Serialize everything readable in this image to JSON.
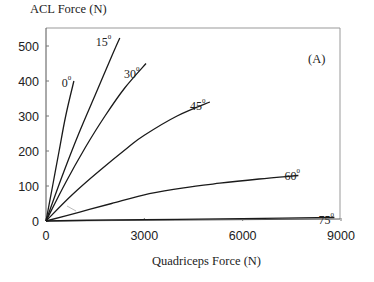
{
  "chart_data": {
    "type": "line",
    "title": "",
    "panel_label": "(A)",
    "xlabel": "Quadriceps Force (N)",
    "ylabel": "ACL Force (N)",
    "xlim": [
      0,
      9000
    ],
    "ylim": [
      0,
      550
    ],
    "xticks": [
      0,
      3000,
      6000,
      9000
    ],
    "yticks": [
      0,
      100,
      200,
      300,
      400,
      500
    ],
    "grid": false,
    "legend": "inline curve labels",
    "series": [
      {
        "name": "0°",
        "label": "0",
        "x": [
          0,
          200,
          400,
          600,
          850
        ],
        "y": [
          0,
          100,
          200,
          300,
          400
        ]
      },
      {
        "name": "15°",
        "label": "15",
        "x": [
          0,
          500,
          1000,
          1500,
          2000,
          2250
        ],
        "y": [
          0,
          130,
          250,
          360,
          470,
          523
        ]
      },
      {
        "name": "30°",
        "label": "30",
        "x": [
          0,
          600,
          1200,
          1800,
          2400,
          3050
        ],
        "y": [
          0,
          110,
          210,
          300,
          380,
          450
        ]
      },
      {
        "name": "45°",
        "label": "45",
        "x": [
          0,
          800,
          1650,
          2500,
          3000,
          4000,
          5000
        ],
        "y": [
          0,
          75,
          145,
          210,
          245,
          300,
          340
        ]
      },
      {
        "name": "60°",
        "label": "60",
        "x": [
          0,
          1000,
          2000,
          3150,
          4200,
          5300,
          6500,
          7700
        ],
        "y": [
          0,
          25,
          50,
          78,
          95,
          108,
          120,
          130
        ]
      },
      {
        "name": "75°",
        "label": "75",
        "x": [
          0,
          2000,
          4000,
          6000,
          8800
        ],
        "y": [
          0,
          3,
          5,
          7,
          10
        ]
      }
    ]
  },
  "labels": {
    "ylabel": "ACL Force (N)",
    "xlabel": "Quadriceps Force (N)",
    "panel": "(A)"
  }
}
